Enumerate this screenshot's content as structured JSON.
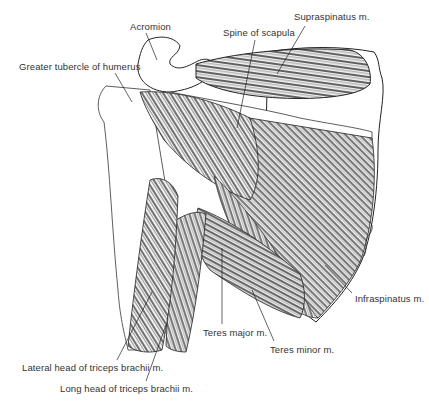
{
  "figure": {
    "labels": {
      "acromion": "Acromion",
      "spine_of_scapula": "Spine of scapula",
      "supraspinatus": "Supraspinatus m.",
      "greater_tubercle": "Greater tubercle of humerus",
      "infraspinatus": "Infraspinatus m.",
      "teres_major": "Teres major m.",
      "teres_minor": "Teres minor m.",
      "lateral_head_triceps": "Lateral head of triceps brachii m.",
      "long_head_triceps": "Long head of triceps brachii m."
    },
    "signature": "artist signature",
    "colors": {
      "ink": "#222222",
      "label": "#333333",
      "background": "#ffffff"
    }
  }
}
